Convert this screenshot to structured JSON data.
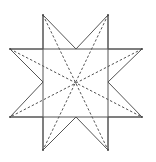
{
  "figure": {
    "stroke_color": "#555555",
    "background": "#ffffff",
    "center": [
      76,
      82
    ],
    "star_outline": [
      [
        43,
        15
      ],
      [
        76,
        49
      ],
      [
        108,
        15
      ],
      [
        108,
        49
      ],
      [
        142,
        49
      ],
      [
        108,
        82
      ],
      [
        142,
        117
      ],
      [
        108,
        117
      ],
      [
        108,
        150
      ],
      [
        76,
        117
      ],
      [
        43,
        150
      ],
      [
        43,
        117
      ],
      [
        10,
        117
      ],
      [
        43,
        82
      ],
      [
        10,
        49
      ],
      [
        43,
        49
      ]
    ],
    "square_lines": {
      "verticals_x": [
        43,
        108
      ],
      "horizontals_y": [
        49,
        117
      ],
      "vertical_span": [
        15,
        150
      ],
      "horizontal_span": [
        10,
        142
      ]
    },
    "dashed_diagonals": [
      {
        "from": [
          43,
          15
        ],
        "to": [
          108,
          150
        ]
      },
      {
        "from": [
          108,
          15
        ],
        "to": [
          43,
          150
        ]
      },
      {
        "from": [
          10,
          49
        ],
        "to": [
          142,
          117
        ]
      },
      {
        "from": [
          142,
          49
        ],
        "to": [
          10,
          117
        ]
      }
    ]
  }
}
